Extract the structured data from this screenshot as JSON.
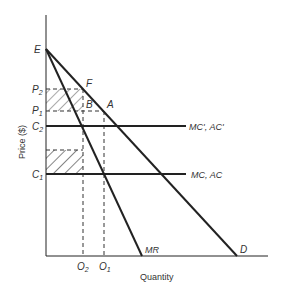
{
  "figure": {
    "axes": {
      "x_label": "Quantity",
      "y_label": "Price ($)"
    },
    "points": {
      "E": "E",
      "F": "F",
      "A": "A",
      "B": "B"
    },
    "y_ticks": {
      "P2": "P",
      "P2_sub": "2",
      "P1": "P",
      "P1_sub": "1",
      "C2": "C",
      "C2_sub": "2",
      "C1": "C",
      "C1_sub": "1"
    },
    "x_ticks": {
      "O2": "O",
      "O2_sub": "2",
      "O1": "O",
      "O1_sub": "1"
    },
    "curves": {
      "mc_prime": "MC', AC'",
      "mc": "MC, AC",
      "mr": "MR",
      "demand": "D"
    },
    "colors": {
      "line": "#222222",
      "hatch": "#999999",
      "hatch_dark": "#333333"
    }
  }
}
